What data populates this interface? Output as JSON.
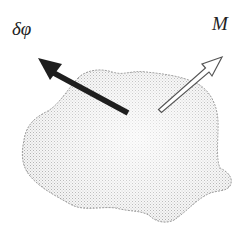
{
  "diagram": {
    "type": "rigid-body-vector-diagram",
    "body": {
      "name": "rigid body",
      "fill_style": "stippled gray"
    },
    "vectors": [
      {
        "id": "dphi",
        "label": "δφ",
        "style": "solid black arrow",
        "direction": "up-left"
      },
      {
        "id": "M",
        "label": "M",
        "style": "hollow outline arrow",
        "direction": "up-right"
      }
    ],
    "colors": {
      "body_stipple": "#b8b8b8",
      "body_outline": "#8a8a8a",
      "solid_arrow": "#1e1e1e",
      "hollow_arrow_stroke": "#555555",
      "label": "#222222"
    }
  }
}
